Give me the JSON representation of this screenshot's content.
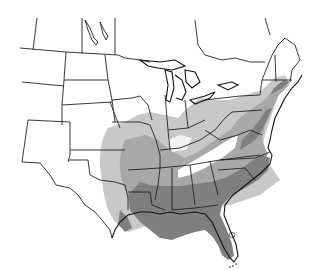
{
  "map": {
    "type": "species-distribution",
    "region": "Eastern and Central United States",
    "projection": "conic",
    "background": "#ffffff",
    "border_color": "#222222",
    "zones": [
      {
        "id": "light",
        "label": "Sparse / peripheral occurrence",
        "color": "#c8c8c8",
        "regions": [
          "eastern Oklahoma",
          "eastern Kansas",
          "central Texas",
          "southern Missouri",
          "southern Illinois",
          "Indiana",
          "Ohio River valley",
          "southern Ontario",
          "Pennsylvania",
          "New York (western)"
        ]
      },
      {
        "id": "mid",
        "label": "Common occurrence",
        "color": "#a8a8a8",
        "regions": [
          "Arkansas",
          "Missouri (south)",
          "Oklahoma (east)",
          "Texas (east)",
          "Kentucky",
          "Tennessee",
          "Virginia",
          "Maryland",
          "New Jersey",
          "Connecticut",
          "Massachusetts"
        ]
      },
      {
        "id": "dark",
        "label": "Core range",
        "color": "#7f7f7f",
        "regions": [
          "Louisiana",
          "Mississippi",
          "Alabama",
          "Georgia",
          "Florida",
          "South Carolina",
          "North Carolina",
          "Virginia (east)",
          "Arkansas (south)",
          "Texas (east coast)"
        ]
      }
    ],
    "notable_features": [
      "Great Lakes outlines",
      "Lake Okeechobee (white)",
      "Florida Keys",
      "Appalachian gap (white band through KY/TN/WV)"
    ]
  }
}
